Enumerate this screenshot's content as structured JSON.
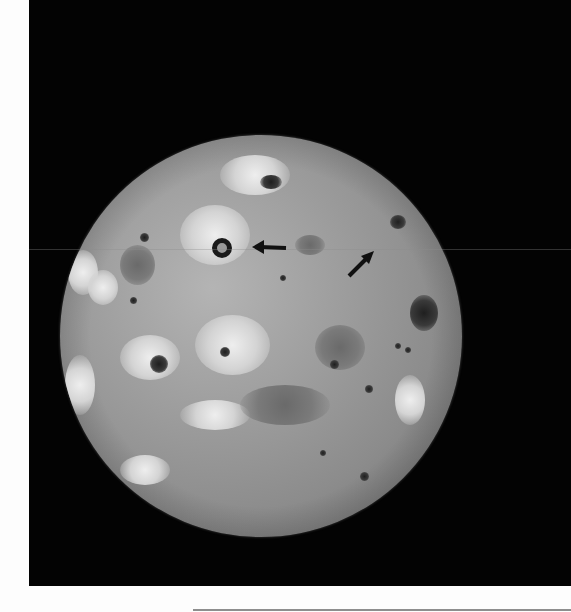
{
  "image": {
    "description": "Grayscale spacecraft photograph of a volcanic moon (Io-like) against black space, with two black arrows marking surface features",
    "palette": {
      "page_background": "#fdfdfd",
      "space_background": "#030303",
      "moon_light": "#d4d4d4",
      "moon_mid": "#9e9e9e",
      "moon_dark": "#3a3a3a",
      "arrow_color": "#111111",
      "bottom_rule": "#8e8e8e"
    },
    "annotations": [
      {
        "type": "arrow",
        "direction": "left",
        "label": ""
      },
      {
        "type": "arrow",
        "direction": "up-right",
        "label": ""
      }
    ]
  }
}
